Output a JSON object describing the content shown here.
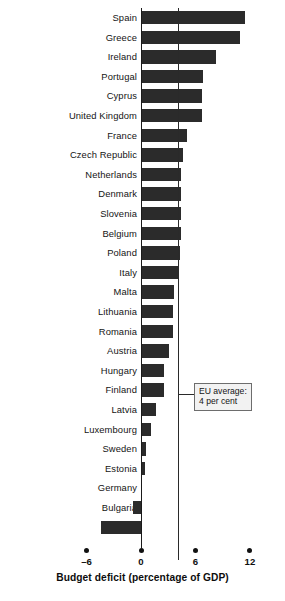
{
  "chart_data": {
    "type": "bar",
    "orientation": "horizontal",
    "title": "",
    "xlabel": "Budget deficit (percentage of GDP)",
    "ylabel": "",
    "xlim": [
      -6,
      12
    ],
    "xticks": [
      -6,
      0,
      6,
      12
    ],
    "xtick_labels": [
      "–6",
      "0",
      "6",
      "12"
    ],
    "grid": false,
    "legend": null,
    "bar_color": "#2b2b2b",
    "zero_line": 0,
    "categories": [
      "Spain",
      "Greece",
      "Ireland",
      "Portugal",
      "Cyprus",
      "United Kingdom",
      "France",
      "Czech Republic",
      "Netherlands",
      "Denmark",
      "Slovenia",
      "Belgium",
      "Poland",
      "Italy",
      "Malta",
      "Lithuania",
      "Romania",
      "Austria",
      "Hungary",
      "Finland",
      "Latvia",
      "Luxembourg",
      "Sweden",
      "Estonia",
      "Germany",
      "Bulgaria",
      "Slovakia"
    ],
    "values": [
      11.4,
      10.9,
      8.3,
      6.8,
      6.7,
      6.7,
      5.1,
      4.6,
      4.4,
      4.4,
      4.4,
      4.4,
      4.3,
      4.1,
      3.6,
      3.5,
      3.5,
      3.1,
      2.5,
      2.5,
      1.7,
      1.1,
      0.6,
      0.4,
      0.1,
      -0.9,
      -4.4
    ],
    "annotations": [
      {
        "name": "eu-average",
        "line1": "EU average:",
        "line2": "4 per cent",
        "value": 4
      }
    ]
  }
}
